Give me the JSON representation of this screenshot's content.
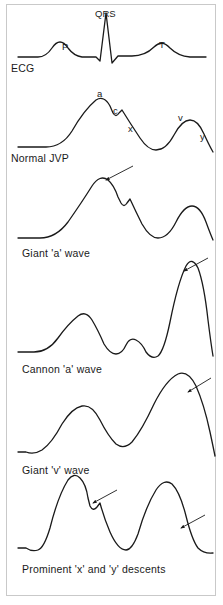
{
  "figure": {
    "title_hidden": "",
    "stroke_color": "#1a1a1a",
    "frame_color": "#c9c9c9",
    "background": "#ffffff"
  },
  "panels": [
    {
      "id": "ecg",
      "label": "ECG",
      "label_x": 11,
      "label_y": 62,
      "annotations": [
        {
          "name": "p-wave-label",
          "text": "P",
          "x": 62,
          "y": 41
        },
        {
          "name": "qrs-complex-label",
          "text": "QRS",
          "x": 95,
          "y": 8
        },
        {
          "name": "t-wave-label",
          "text": "T",
          "x": 159,
          "y": 39
        }
      ],
      "arrows": []
    },
    {
      "id": "normal-jvp",
      "label": "Normal JVP",
      "label_x": 11,
      "label_y": 152,
      "annotations": [
        {
          "name": "a-wave-label",
          "text": "a",
          "x": 97,
          "y": 88
        },
        {
          "name": "c-wave-label",
          "text": "c",
          "x": 113,
          "y": 105
        },
        {
          "name": "x-descent-label",
          "text": "x",
          "x": 128,
          "y": 123
        },
        {
          "name": "v-wave-label",
          "text": "v",
          "x": 178,
          "y": 112
        },
        {
          "name": "y-descent-label",
          "text": "y",
          "x": 200,
          "y": 131
        }
      ],
      "arrows": []
    },
    {
      "id": "giant-a-wave",
      "label": "Giant 'a' wave",
      "label_x": 22,
      "label_y": 247,
      "annotations": [],
      "arrows": [
        {
          "name": "giant-a-wave-arrow",
          "x1": 133,
          "y1": 166,
          "x2": 106,
          "y2": 180
        }
      ]
    },
    {
      "id": "cannon-a-wave",
      "label": "Cannon 'a' wave",
      "label_x": 22,
      "label_y": 363,
      "annotations": [],
      "arrows": [
        {
          "name": "cannon-a-wave-arrow",
          "x1": 208,
          "y1": 258,
          "x2": 184,
          "y2": 271
        }
      ]
    },
    {
      "id": "giant-v-wave",
      "label": "Giant 'v' wave",
      "label_x": 22,
      "label_y": 464,
      "annotations": [],
      "arrows": [
        {
          "name": "giant-v-wave-arrow",
          "x1": 211,
          "y1": 378,
          "x2": 188,
          "y2": 392
        }
      ]
    },
    {
      "id": "prominent-x-y-descents",
      "label": "Prominent 'x' and 'y' descents",
      "label_x": 22,
      "label_y": 563,
      "annotations": [],
      "arrows": [
        {
          "name": "x-descent-arrow",
          "x1": 117,
          "y1": 490,
          "x2": 93,
          "y2": 503
        },
        {
          "name": "y-descent-arrow",
          "x1": 205,
          "y1": 515,
          "x2": 181,
          "y2": 528
        }
      ]
    }
  ],
  "chart_data": {
    "type": "line",
    "xlabel": "",
    "ylabel": "",
    "grid": false,
    "legend": false,
    "series": [
      {
        "name": "ECG",
        "label": "ECG",
        "baseline_y": 57,
        "path": "M 18 57 L 38 57 Q 46 57 52 48 Q 60 36 68 48 Q 74 56 82 57 L 96 57 L 100 61 L 106 13 L 112 63 L 118 56 L 132 56 Q 145 56 154 47 Q 162 39 170 48 Q 178 56 190 57 L 206 57",
        "features": [
          "P wave",
          "QRS complex",
          "T wave"
        ]
      },
      {
        "name": "Normal JVP",
        "label": "Normal JVP",
        "baseline_y": 147,
        "path": "M 18 147 L 46 147 Q 62 147 72 131 Q 84 110 96 100 Q 104 95 110 106 L 113 113 Q 116 118 119 113 L 122 110 Q 130 123 140 138 Q 148 150 156 150 Q 166 150 174 135 Q 182 120 190 120 Q 198 120 204 134 Q 209 145 213 152",
        "features": [
          "a wave",
          "c wave",
          "x descent",
          "v wave",
          "y descent"
        ]
      },
      {
        "name": "Giant 'a' wave",
        "label": "Giant 'a' wave",
        "baseline_y": 238,
        "path": "M 18 238 L 40 238 Q 56 238 68 222 Q 82 202 92 186 Q 100 174 108 180 Q 114 185 118 197 L 121 203 Q 124 208 127 203 L 130 199 Q 136 212 142 224 Q 150 238 158 238 Q 168 238 176 222 Q 184 206 192 206 Q 200 206 206 222 Q 210 233 213 240",
        "features": [
          "exaggerated a wave"
        ]
      },
      {
        "name": "Cannon 'a' wave",
        "label": "Cannon 'a' wave",
        "baseline_y": 352,
        "path": "M 18 352 L 34 352 Q 48 352 58 338 Q 68 324 78 316 Q 86 310 92 320 Q 98 330 104 344 Q 110 354 116 354 Q 122 354 126 345 Q 130 337 136 340 Q 142 343 146 352 Q 152 360 158 356 Q 164 351 170 322 Q 178 282 186 266 Q 192 256 198 268 Q 204 284 208 320 Q 211 344 213 356",
        "features": [
          "cannon a wave spike"
        ]
      },
      {
        "name": "Giant 'v' wave",
        "label": "Giant 'v' wave",
        "baseline_y": 452,
        "path": "M 18 452 L 26 452 Q 34 455 42 450 Q 52 443 62 424 Q 72 408 82 406 Q 92 404 100 420 Q 108 436 116 444 Q 124 450 132 442 Q 142 430 154 404 Q 166 380 178 374 Q 188 370 196 386 Q 204 404 210 432 Q 213 446 215 456",
        "features": [
          "giant v wave",
          "rapid y descent"
        ]
      },
      {
        "name": "Prominent 'x' and 'y' descents",
        "label": "Prominent 'x' and 'y' descents",
        "baseline_y": 548,
        "path": "M 18 548 L 26 548 Q 32 552 38 550 Q 44 548 50 528 Q 58 496 68 480 Q 74 472 80 478 Q 86 484 88 498 L 90 506 Q 93 512 97 507 L 100 503 Q 104 518 110 532 Q 118 550 126 550 Q 132 550 138 534 Q 146 506 156 490 Q 164 478 172 484 Q 180 492 186 516 Q 192 540 198 548 Q 204 554 213 553",
        "features": [
          "steep x descent",
          "steep y descent"
        ]
      }
    ]
  }
}
